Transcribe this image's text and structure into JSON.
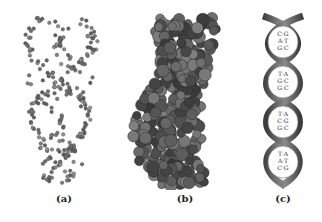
{
  "figure": {
    "panels": [
      {
        "id": "a",
        "caption": "(a)",
        "model": "ball-and-stick"
      },
      {
        "id": "b",
        "caption": "(b)",
        "model": "space-filling"
      },
      {
        "id": "c",
        "caption": "(c)",
        "model": "ribbon-helix"
      }
    ],
    "base_pairs": [
      [
        "C=G",
        "A=T",
        "G=C"
      ],
      [
        "T=A",
        "G=C",
        "G=C"
      ],
      [
        "T=A",
        "C=G",
        "G=C"
      ],
      [
        "T=A",
        "A=T",
        "C=G"
      ]
    ],
    "colors": {
      "atom_dark": "#3a3a3a",
      "atom_light": "#9a9a9a",
      "ribbon": "#5a5a5a",
      "background": "#ffffff"
    }
  }
}
